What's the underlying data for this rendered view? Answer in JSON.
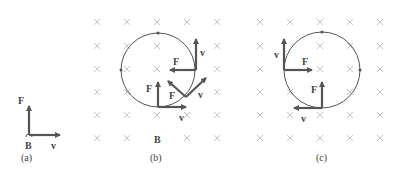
{
  "figure": {
    "panels": [
      {
        "id": "a",
        "caption": "(a)",
        "labels": {
          "force": "F",
          "velocity": "v",
          "field": "B"
        }
      },
      {
        "id": "b",
        "caption": "(b)",
        "field_symbol": "×",
        "field_label": "B",
        "labels": {
          "force_1": "F",
          "velocity_1": "v",
          "force_2": "F",
          "velocity_2": "v",
          "force_3": "F",
          "velocity_3": "v"
        }
      },
      {
        "id": "c",
        "caption": "(c)",
        "field_symbol": "×",
        "labels": {
          "force_1": "F",
          "velocity_1": "v",
          "force_2": "F",
          "velocity_2": "v"
        }
      }
    ],
    "colors": {
      "vector": "#555555",
      "field_mark": "#c4c4c4",
      "orbit": "#555555"
    }
  }
}
